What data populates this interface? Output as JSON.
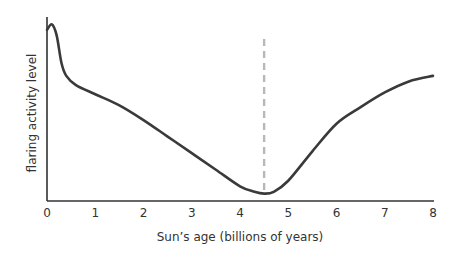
{
  "chart_data": {
    "type": "line",
    "title": "",
    "xlabel": "Sun’s age (billions of years)",
    "ylabel": "flaring activity level",
    "xlim": [
      0,
      8
    ],
    "ylim": [
      0,
      1
    ],
    "x_ticks": [
      "0",
      "1",
      "2",
      "3",
      "4",
      "5",
      "6",
      "7",
      "8"
    ],
    "y_ticks": [],
    "grid": false,
    "legend": null,
    "series": [
      {
        "name": "flaring activity",
        "x": [
          0,
          0.1,
          0.2,
          0.3,
          0.4,
          0.6,
          1.0,
          1.5,
          2.0,
          2.5,
          3.0,
          3.5,
          4.0,
          4.3,
          4.5,
          4.7,
          5.0,
          5.5,
          6.0,
          6.5,
          7.0,
          7.5,
          8.0
        ],
        "y": [
          0.93,
          0.96,
          0.9,
          0.75,
          0.68,
          0.63,
          0.58,
          0.52,
          0.44,
          0.35,
          0.26,
          0.17,
          0.08,
          0.05,
          0.04,
          0.05,
          0.11,
          0.27,
          0.42,
          0.51,
          0.59,
          0.65,
          0.68
        ],
        "color": "#3a3a3a"
      }
    ],
    "annotations": [
      {
        "type": "vertical-dashed-line",
        "x": 4.5,
        "y_from": 0.04,
        "y_to": 0.88,
        "color": "#b8b8b8",
        "meaning": "current age of the Sun"
      }
    ]
  }
}
